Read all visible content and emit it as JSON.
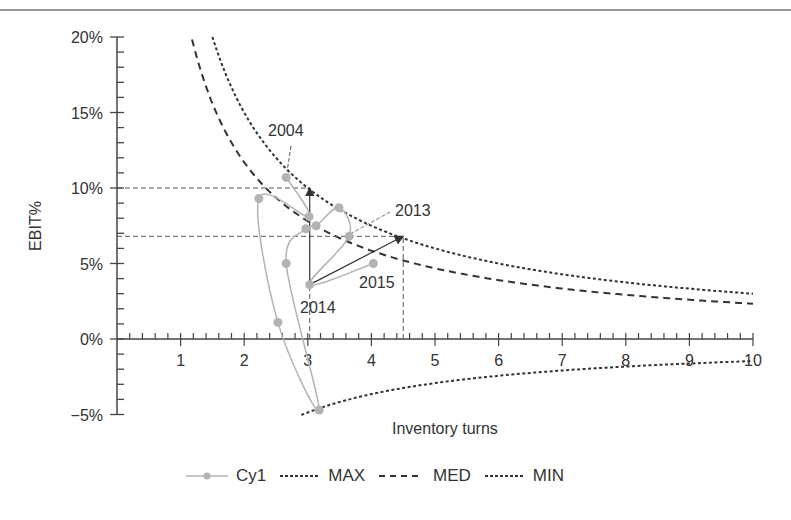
{
  "chart_data": {
    "type": "line",
    "title": "",
    "xlabel": "Inventory turns",
    "ylabel": "EBIT%",
    "xlim": [
      0,
      10
    ],
    "ylim": [
      -5,
      20
    ],
    "x_ticks": [
      "1",
      "2",
      "3",
      "4",
      "5",
      "6",
      "7",
      "8",
      "9",
      "10"
    ],
    "y_ticks": [
      "20%",
      "15%",
      "10%",
      "5%",
      "0%",
      "−5%"
    ],
    "grid": false,
    "legend_position": "bottom",
    "legend": [
      "Cy1",
      "MAX",
      "MED",
      "MIN"
    ],
    "series": [
      {
        "name": "Cy1",
        "style": "smooth line with markers",
        "color": "#b3b3b3",
        "points": [
          {
            "x": 2.66,
            "y": 10.7,
            "label": "2004"
          },
          {
            "x": 3.02,
            "y": 8.1
          },
          {
            "x": 2.23,
            "y": 9.3
          },
          {
            "x": 2.53,
            "y": 1.1
          },
          {
            "x": 3.18,
            "y": -4.7
          },
          {
            "x": 2.66,
            "y": 5.0
          },
          {
            "x": 2.97,
            "y": 7.3
          },
          {
            "x": 3.13,
            "y": 7.5
          },
          {
            "x": 3.49,
            "y": 8.7
          },
          {
            "x": 3.65,
            "y": 6.8,
            "label": "2013"
          },
          {
            "x": 3.03,
            "y": 3.6,
            "label": "2014"
          },
          {
            "x": 4.03,
            "y": 5.0,
            "label": "2015"
          }
        ]
      },
      {
        "name": "MAX",
        "style": "dotted",
        "formula": "30 / x",
        "x_range": [
          1.5,
          10
        ],
        "color": "#333333"
      },
      {
        "name": "MED",
        "style": "dashed",
        "formula": "23.4 / x",
        "x_range": [
          1.18,
          10
        ],
        "color": "#333333"
      },
      {
        "name": "MIN",
        "style": "dotted",
        "formula": "-14.6 / x",
        "x_range": [
          2.9,
          10
        ],
        "color": "#333333"
      }
    ],
    "annotations": {
      "reference_lines": [
        {
          "type": "horizontal",
          "y": 10,
          "x_to": 3.03
        },
        {
          "type": "horizontal",
          "y": 6.8,
          "x_to": 4.5
        },
        {
          "type": "vertical",
          "x": 3.03,
          "y_from": 0,
          "y_to": 3.6
        },
        {
          "type": "vertical",
          "x": 4.5,
          "y_from": 0,
          "y_to": 6.8
        }
      ],
      "arrows": [
        {
          "from": {
            "x": 3.03,
            "y": 3.6
          },
          "to": {
            "x": 3.03,
            "y": 10
          }
        },
        {
          "from": {
            "x": 3.03,
            "y": 3.6
          },
          "to": {
            "x": 4.5,
            "y": 6.8
          }
        }
      ],
      "labels": [
        "2004",
        "2013",
        "2014",
        "2015"
      ]
    }
  },
  "axes": {
    "xlabel": "Inventory turns",
    "ylabel": "EBIT%",
    "x_tick_labels": [
      "1",
      "2",
      "3",
      "4",
      "5",
      "6",
      "7",
      "8",
      "9",
      "10"
    ],
    "y_tick_labels": [
      "20%",
      "15%",
      "10%",
      "5%",
      "0%",
      "−5%"
    ]
  },
  "annotations": {
    "y2004": "2004",
    "y2013": "2013",
    "y2014": "2014",
    "y2015": "2015"
  },
  "legend": {
    "cy1": "Cy1",
    "max": "MAX",
    "med": "MED",
    "min": "MIN"
  }
}
